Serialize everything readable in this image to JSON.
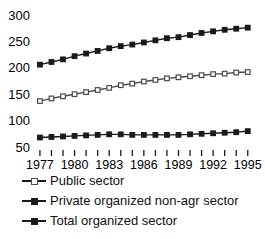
{
  "chart_data": {
    "type": "line",
    "title": "",
    "subtitle": "",
    "xlabel": "",
    "ylabel": "",
    "grid": false,
    "legend_position": "bottom-left",
    "x": [
      1977,
      1978,
      1979,
      1980,
      1981,
      1982,
      1983,
      1984,
      1985,
      1986,
      1987,
      1988,
      1989,
      1990,
      1991,
      1992,
      1993,
      1994,
      1995
    ],
    "xtick_labels": [
      "1977",
      "1980",
      "1983",
      "1986",
      "1989",
      "1992",
      "1995"
    ],
    "xtick_values": [
      1977,
      1980,
      1983,
      1986,
      1989,
      1992,
      1995
    ],
    "xlim": [
      1976.4,
      1995.8
    ],
    "ylim": [
      50,
      300
    ],
    "ytick_labels": [
      "50",
      "100",
      "150",
      "200",
      "250",
      "300"
    ],
    "ytick_values": [
      50,
      100,
      150,
      200,
      250,
      300
    ],
    "series": [
      {
        "name": "Public sector",
        "marker": "open-square",
        "color": "#4a4a4a",
        "values": [
          137,
          142,
          146,
          150,
          154,
          158,
          162,
          167,
          170,
          174,
          177,
          180,
          182,
          184,
          186,
          188,
          189,
          191,
          192
        ]
      },
      {
        "name": "Private organized non-agr sector",
        "marker": "filled-square",
        "color": "#1a1a1a",
        "values": [
          68,
          69,
          70,
          71,
          72,
          73,
          74,
          74,
          73,
          73,
          73,
          73,
          73,
          74,
          75,
          76,
          77,
          78,
          80
        ]
      },
      {
        "name": "Total organized sector",
        "marker": "filled-square",
        "color": "#1a1a1a",
        "values": [
          206,
          211,
          216,
          222,
          227,
          232,
          237,
          241,
          244,
          248,
          252,
          256,
          258,
          262,
          266,
          269,
          272,
          274,
          276
        ]
      }
    ]
  },
  "legend": {
    "items": [
      {
        "label": "Public sector",
        "marker": "open-square"
      },
      {
        "label": "Private organized non-agr sector",
        "marker": "filled-square"
      },
      {
        "label": "Total organized sector",
        "marker": "filled-square"
      }
    ]
  },
  "colors": {
    "background": "#ffffff",
    "ink": "#1a1a1a",
    "hollow_marker_edge": "#4a4a4a"
  }
}
